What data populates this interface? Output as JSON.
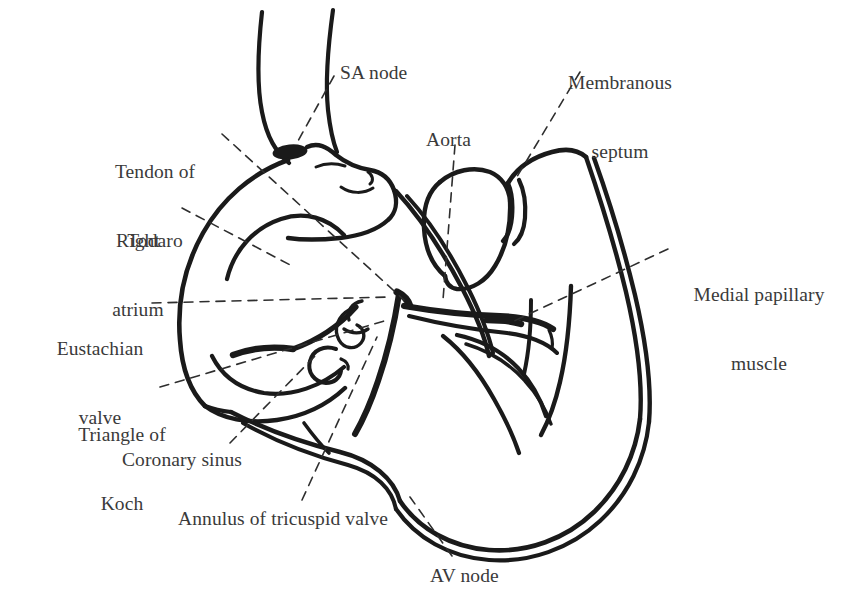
{
  "figure": {
    "kind": "anatomical-line-drawing",
    "background_color": "#ffffff",
    "line_color": "#1a1a1a",
    "text_color": "#3a3a3a",
    "leader_line_color": "#2e2e2e",
    "leader_line_style": "dashed",
    "width": 861,
    "height": 615
  },
  "labels": [
    {
      "id": "sa-node",
      "text": "SA node",
      "lines": [
        "SA node"
      ],
      "align": "left",
      "x": 340,
      "y": 61,
      "width": 120
    },
    {
      "id": "membranous-septum",
      "text": "Membranous septum",
      "lines": [
        "Membranous",
        "septum"
      ],
      "align": "center",
      "x": 550,
      "y": 25,
      "width": 140
    },
    {
      "id": "tendon-of-todaro",
      "text": "Tendon of Todaro",
      "lines": [
        "Tendon of",
        "Todaro"
      ],
      "align": "center",
      "x": 92,
      "y": 114,
      "width": 126
    },
    {
      "id": "aorta",
      "text": "Aorta",
      "lines": [
        "Aorta"
      ],
      "align": "left",
      "x": 426,
      "y": 128,
      "width": 80
    },
    {
      "id": "right-atrium",
      "text": "Right atrium",
      "lines": [
        "Right",
        "atrium"
      ],
      "align": "center",
      "x": 96,
      "y": 183,
      "width": 84
    },
    {
      "id": "medial-papillary-muscle",
      "text": "Medial papillary muscle",
      "lines": [
        "Medial papillary",
        "muscle"
      ],
      "align": "center",
      "x": 676,
      "y": 237,
      "width": 166
    },
    {
      "id": "eustachian-valve",
      "text": "Eustachian valve",
      "lines": [
        "Eustachian",
        "valve"
      ],
      "align": "center",
      "x": 36,
      "y": 291,
      "width": 128
    },
    {
      "id": "triangle-of-koch",
      "text": "Triangle of Koch",
      "lines": [
        "Triangle of",
        "Koch"
      ],
      "align": "center",
      "x": 60,
      "y": 377,
      "width": 124
    },
    {
      "id": "coronary-sinus",
      "text": "Coronary sinus",
      "lines": [
        "Coronary sinus"
      ],
      "align": "left",
      "x": 122,
      "y": 448,
      "width": 160
    },
    {
      "id": "annulus-of-tricuspid-valve",
      "text": "Annulus of tricuspid valve",
      "lines": [
        "Annulus of tricuspid valve"
      ],
      "align": "left",
      "x": 178,
      "y": 507,
      "width": 260
    },
    {
      "id": "av-node",
      "text": "AV node",
      "lines": [
        "AV node"
      ],
      "align": "left",
      "x": 430,
      "y": 564,
      "width": 110
    }
  ],
  "structures": [
    {
      "id": "superior-vena-cava",
      "name": "Superior vena cava"
    },
    {
      "id": "sa-node-marker",
      "name": "SA node (filled marker)"
    },
    {
      "id": "right-atrial-wall",
      "name": "Right atrial free wall"
    },
    {
      "id": "crista-terminalis",
      "name": "Crista terminalis"
    },
    {
      "id": "aortic-root",
      "name": "Aortic root"
    },
    {
      "id": "interventricular-septum",
      "name": "Interventricular septum"
    },
    {
      "id": "right-ventricular-wall",
      "name": "Right ventricular free wall"
    },
    {
      "id": "tricuspid-annulus",
      "name": "Tricuspid valve annulus"
    },
    {
      "id": "tricuspid-leaflets",
      "name": "Tricuspid valve leaflets"
    },
    {
      "id": "eustachian-ridge",
      "name": "Eustachian valve ridge"
    },
    {
      "id": "coronary-sinus-ostium",
      "name": "Coronary sinus ostium"
    },
    {
      "id": "medial-papillary-marker",
      "name": "Medial papillary muscle marker"
    },
    {
      "id": "trabeculae",
      "name": "Ventricular trabeculae"
    }
  ]
}
